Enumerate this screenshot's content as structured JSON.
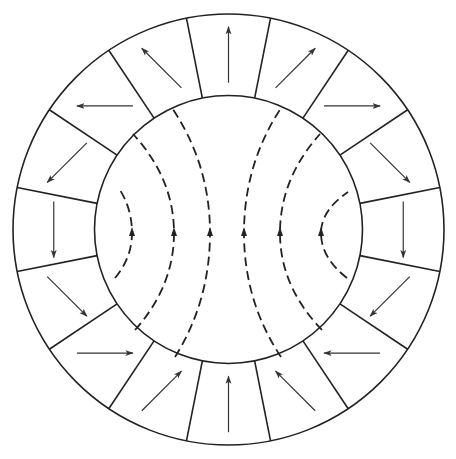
{
  "diagram": {
    "type": "halbach-cylinder",
    "width": 456,
    "height": 459,
    "center": [
      228.5,
      229.5
    ],
    "outer_radius": 215.5,
    "inner_radius": 134,
    "segment_count": 16,
    "segment_offset_deg": 11.25,
    "stroke_color": "#222222",
    "arrow_color": "#333333",
    "arrow_length": 56,
    "segments": [
      {
        "angle_deg": 0,
        "arrow": "up"
      },
      {
        "angle_deg": 22.5,
        "arrow": "up-right"
      },
      {
        "angle_deg": 45,
        "arrow": "right"
      },
      {
        "angle_deg": 67.5,
        "arrow": "down-right"
      },
      {
        "angle_deg": 90,
        "arrow": "down"
      },
      {
        "angle_deg": 112.5,
        "arrow": "down-left"
      },
      {
        "angle_deg": 135,
        "arrow": "left"
      },
      {
        "angle_deg": 157.5,
        "arrow": "up-left"
      },
      {
        "angle_deg": 180,
        "arrow": "up"
      },
      {
        "angle_deg": 202.5,
        "arrow": "up-right"
      },
      {
        "angle_deg": 225,
        "arrow": "right"
      },
      {
        "angle_deg": 247.5,
        "arrow": "down-right"
      },
      {
        "angle_deg": 270,
        "arrow": "down"
      },
      {
        "angle_deg": 292.5,
        "arrow": "down-left"
      },
      {
        "angle_deg": 315,
        "arrow": "left"
      },
      {
        "angle_deg": 337.5,
        "arrow": "up-left"
      }
    ],
    "field_lines": [
      {
        "name": "left-inner",
        "start": [
          120,
          190
        ],
        "ctrl": [
          133,
          210
        ],
        "mid": [
          132,
          233
        ],
        "end": [
          115,
          278
        ]
      },
      {
        "name": "left-middle",
        "start": [
          133,
          134
        ],
        "mid": [
          174,
          233
        ],
        "end": [
          135,
          330
        ]
      },
      {
        "name": "left-center",
        "start": [
          172,
          108
        ],
        "mid": [
          210,
          233
        ],
        "end": [
          175,
          357
        ]
      },
      {
        "name": "right-center",
        "start": [
          281,
          108
        ],
        "mid": [
          244,
          233
        ],
        "end": [
          281,
          357
        ]
      },
      {
        "name": "right-middle",
        "start": [
          320,
          134
        ],
        "mid": [
          280,
          233
        ],
        "end": [
          322,
          330
        ]
      },
      {
        "name": "right-inner",
        "start": [
          348,
          192
        ],
        "mid": [
          321,
          233
        ],
        "end": [
          347,
          278
        ]
      }
    ],
    "field_line_dash": "9 5",
    "field_direction": "up"
  }
}
